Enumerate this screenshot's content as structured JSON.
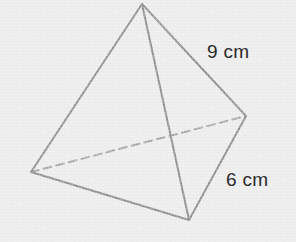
{
  "figure": {
    "name": "tetrahedron-diagram",
    "shape_type": "triangular-pyramid",
    "background_color": "#eeeeee",
    "edge_color": "#8f8f8f",
    "hidden_edge_color": "#a8a8a8",
    "edge_width": 2,
    "hidden_edge_dash": "8,5",
    "label_color": "#2b2b2b",
    "vertices": {
      "apex": {
        "name": "apex-vertex",
        "x": 142,
        "y": 4
      },
      "right": {
        "name": "right-back-vertex",
        "x": 246,
        "y": 116
      },
      "left": {
        "name": "left-back-vertex",
        "x": 31,
        "y": 172
      },
      "bottom": {
        "name": "bottom-front-vertex",
        "x": 189,
        "y": 220
      }
    },
    "edges": [
      {
        "name": "edge-apex-left",
        "from": "apex",
        "to": "left",
        "hidden": false
      },
      {
        "name": "edge-apex-right",
        "from": "apex",
        "to": "right",
        "hidden": false
      },
      {
        "name": "edge-apex-bottom",
        "from": "apex",
        "to": "bottom",
        "hidden": false
      },
      {
        "name": "edge-left-bottom",
        "from": "left",
        "to": "bottom",
        "hidden": false
      },
      {
        "name": "edge-right-bottom",
        "from": "right",
        "to": "bottom",
        "hidden": false
      },
      {
        "name": "edge-left-right",
        "from": "left",
        "to": "right",
        "hidden": true
      }
    ],
    "labels": {
      "slant_edge": {
        "text": "9 cm",
        "x": 207,
        "y": 42,
        "measures": "edge-apex-right"
      },
      "base_edge": {
        "text": "6 cm",
        "x": 226,
        "y": 170,
        "measures": "edge-right-bottom"
      }
    }
  }
}
